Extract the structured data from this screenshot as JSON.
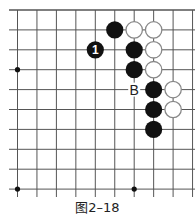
{
  "figure": {
    "caption": "图2–18",
    "type": "go-board-diagram"
  },
  "board": {
    "cols": 10,
    "rows": 10,
    "origin_x": 17.5,
    "origin_y": 10,
    "spacing_x": 19.45,
    "spacing_y": 19.9,
    "line_color": "#555555",
    "stone_black": "#111111",
    "stone_white_fill": "#ffffff",
    "stone_white_stroke": "#888888",
    "star_points": [
      {
        "col": 0,
        "row": 3
      },
      {
        "col": 0,
        "row": 9
      },
      {
        "col": 6,
        "row": 9
      }
    ],
    "stones": [
      {
        "col": 5,
        "row": 1,
        "color": "black"
      },
      {
        "col": 6,
        "row": 1,
        "color": "white"
      },
      {
        "col": 7,
        "row": 1,
        "color": "white"
      },
      {
        "col": 4,
        "row": 2,
        "color": "black",
        "label": "1"
      },
      {
        "col": 6,
        "row": 2,
        "color": "black"
      },
      {
        "col": 7,
        "row": 2,
        "color": "white"
      },
      {
        "col": 6,
        "row": 3,
        "color": "black"
      },
      {
        "col": 7,
        "row": 3,
        "color": "white"
      },
      {
        "col": 7,
        "row": 4,
        "color": "black"
      },
      {
        "col": 8,
        "row": 4,
        "color": "white"
      },
      {
        "col": 7,
        "row": 5,
        "color": "black"
      },
      {
        "col": 8,
        "row": 5,
        "color": "white"
      },
      {
        "col": 7,
        "row": 6,
        "color": "black"
      }
    ],
    "markers": [
      {
        "col": 6,
        "row": 4,
        "text": "B"
      }
    ]
  }
}
